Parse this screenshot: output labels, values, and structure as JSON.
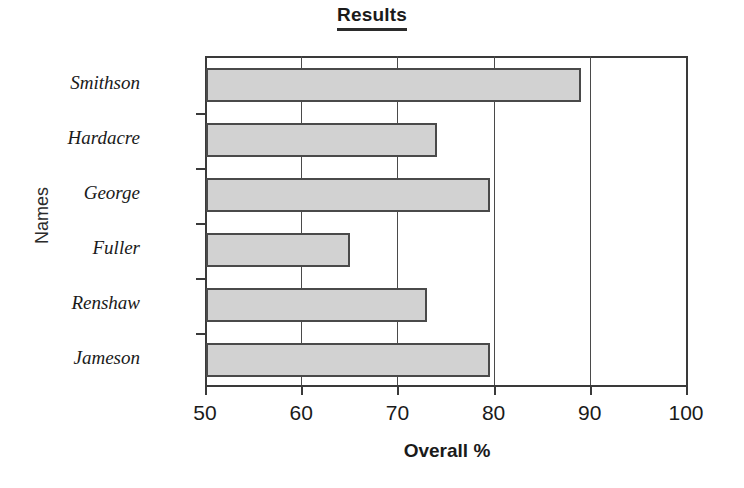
{
  "chart_data": {
    "type": "bar",
    "orientation": "horizontal",
    "title": "Results",
    "xlabel": "Overall %",
    "ylabel": "Names",
    "categories": [
      "Smithson",
      "Hardacre",
      "George",
      "Fuller",
      "Renshaw",
      "Jameson"
    ],
    "values": [
      89,
      74,
      79.5,
      65,
      73,
      79.5
    ],
    "xlim": [
      50,
      100
    ],
    "xticks": [
      50,
      60,
      70,
      80,
      90,
      100
    ],
    "xtick_labels": [
      "50",
      "60",
      "70",
      "80",
      "90",
      "100"
    ],
    "grid": "vertical",
    "legend": "none",
    "bar_fill": "#d2d2d2",
    "bar_border": "#4a4a4a",
    "axis_color": "#3a3a3a",
    "text_color": "#1a1a1a"
  },
  "title": {
    "text": "Results"
  },
  "axes": {
    "x_title": "Overall %",
    "y_title": "Names"
  }
}
